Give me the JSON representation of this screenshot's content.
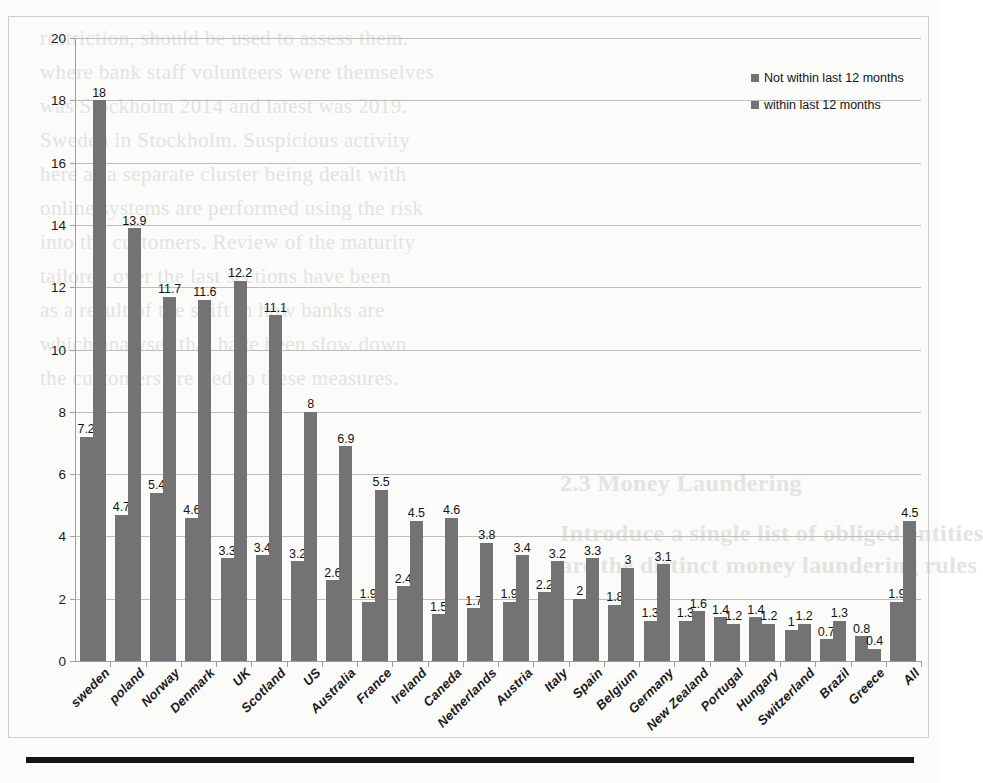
{
  "chart_data": {
    "type": "bar",
    "title": "",
    "subtitle": "",
    "xlabel": "",
    "ylabel": "",
    "ylim": [
      0,
      20
    ],
    "ytick_step": 2,
    "yticks": [
      0,
      2,
      4,
      6,
      8,
      10,
      12,
      14,
      16,
      18,
      20
    ],
    "grid": true,
    "legend_position": "top-right",
    "categories": [
      "sweden",
      "poland",
      "Norway",
      "Denmark",
      "UK",
      "Scotland",
      "US",
      "Australia",
      "France",
      "Ireland",
      "Caneda",
      "Netherlands",
      "Austria",
      "Italy",
      "Spain",
      "Belgium",
      "Germany",
      "New Zealand",
      "Portugal",
      "Hungary",
      "Switzerland",
      "Brazil",
      "Greece",
      "All"
    ],
    "series": [
      {
        "name": "within last 12 months",
        "color": "#737373",
        "values": [
          7.2,
          4.7,
          5.4,
          4.6,
          3.3,
          3.4,
          3.2,
          2.6,
          1.9,
          2.4,
          1.5,
          1.7,
          1.9,
          2.2,
          2,
          1.8,
          1.3,
          1.3,
          1.4,
          1.4,
          1,
          0.7,
          0.8,
          1.9
        ],
        "labels": [
          "7.2",
          "4.7",
          "5.4",
          "4.6",
          "3.3",
          "3.4",
          "3.2",
          "2.6",
          "1.9",
          "2.4",
          "1.5",
          "1.7",
          "1.9",
          "2.2",
          "2",
          "1.8",
          "1.3",
          "1.3",
          "1.4",
          "1.4",
          "1",
          "0.7",
          "0.8",
          "1.9"
        ]
      },
      {
        "name": "Not within last 12 months",
        "color": "#737373",
        "values": [
          18,
          13.9,
          11.7,
          11.6,
          12.2,
          11.1,
          8,
          6.9,
          5.5,
          4.5,
          4.6,
          3.8,
          3.4,
          3.2,
          3.3,
          3,
          3.1,
          1.6,
          1.2,
          1.2,
          1.2,
          1.3,
          0.4,
          4.5
        ],
        "labels": [
          "18",
          "13.9",
          "11.7",
          "11.6",
          "12.2",
          "11.1",
          "8",
          "6.9",
          "5.5",
          "4.5",
          "4.6",
          "3.8",
          "3.4",
          "3.2",
          "3.3",
          "3",
          "3.1",
          "1.6",
          "1.2",
          "1.2",
          "1.2",
          "1.3",
          "0.4",
          "4.5"
        ]
      }
    ]
  },
  "legend": {
    "entries": [
      {
        "label": "Not within last 12 months",
        "color": "#737373"
      },
      {
        "label": "within last 12 months",
        "color": "#737373"
      }
    ]
  },
  "ghost_text": [
    "restriction, should be used to assess them.",
    "where bank staff volunteers were themselves",
    "was Stockholm 2014 and latest was 2019.",
    "Sweden in Stockholm. Suspicious activity",
    "here as a separate cluster being dealt with",
    "online systems are performed using the risk",
    "into the customers. Review of the maturity",
    "tailored over the last sections have been",
    "as a result of the shift in how banks are",
    "which analyses that have been slow down",
    "the customers are tied to these measures.",
    "2.3  Money Laundering",
    "Introduce a single list of obliged entities",
    "are the distinct money laundering rules"
  ]
}
